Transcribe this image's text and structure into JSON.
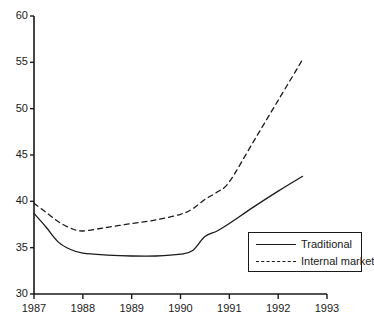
{
  "chart_data": {
    "type": "line",
    "title": "",
    "subtitle": "",
    "xlabel": "",
    "ylabel": "",
    "xlim": [
      1987,
      1993
    ],
    "ylim": [
      30,
      60
    ],
    "grid": false,
    "legend_position": "bottom-right",
    "x_ticks": [
      "1987",
      "1988",
      "1989",
      "1990",
      "1991",
      "1992",
      "1993"
    ],
    "x_tick_values": [
      1987,
      1988,
      1989,
      1990,
      1991,
      1992,
      1993
    ],
    "y_ticks": [
      "30",
      "35",
      "40",
      "45",
      "50",
      "55",
      "60"
    ],
    "y_tick_values": [
      30,
      35,
      40,
      45,
      50,
      55,
      60
    ],
    "series": [
      {
        "name": "Traditional",
        "style": "solid",
        "color": "#1a1a1a",
        "x": [
          1987.0,
          1987.25,
          1987.5,
          1987.75,
          1988.0,
          1988.5,
          1989.0,
          1989.5,
          1990.0,
          1990.25,
          1990.5,
          1990.75,
          1991.0,
          1991.5,
          1992.0,
          1992.5
        ],
        "values": [
          38.7,
          37.2,
          35.6,
          34.8,
          34.4,
          34.2,
          34.1,
          34.1,
          34.3,
          34.7,
          36.2,
          36.8,
          37.6,
          39.4,
          41.1,
          42.7
        ]
      },
      {
        "name": "Internal market",
        "style": "dashed",
        "color": "#1a1a1a",
        "x": [
          1987.0,
          1987.25,
          1987.5,
          1987.75,
          1988.0,
          1988.5,
          1989.0,
          1989.5,
          1990.0,
          1990.25,
          1990.5,
          1990.75,
          1991.0,
          1991.5,
          1992.0,
          1992.5
        ],
        "values": [
          39.8,
          38.8,
          37.8,
          37.1,
          36.8,
          37.2,
          37.6,
          38.0,
          38.6,
          39.2,
          40.2,
          41.0,
          42.1,
          46.5,
          50.9,
          55.3
        ]
      }
    ]
  },
  "legend": {
    "entries": [
      {
        "label": "Traditional",
        "style": "solid"
      },
      {
        "label": "Internal market",
        "style": "dashed"
      }
    ]
  }
}
